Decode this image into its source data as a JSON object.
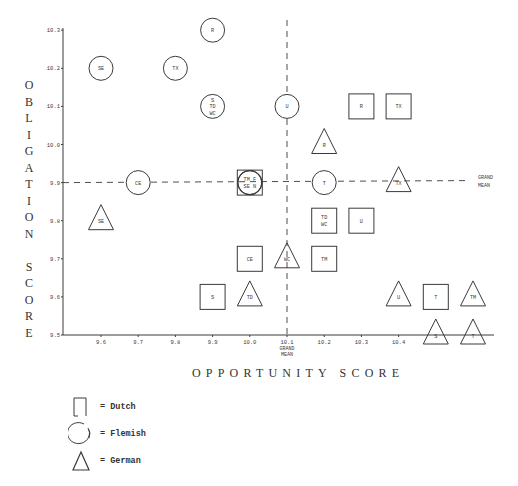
{
  "chart_data": {
    "type": "scatter",
    "title": "",
    "xlabel": "OPPORTUNITY SCORE",
    "ylabel": "OBLIGATION SCORE",
    "xlim": [
      9.5,
      10.6
    ],
    "ylim": [
      9.5,
      10.3
    ],
    "x_ticks": [
      "9.6",
      "9.7",
      "9.8",
      "9.9",
      "10.0",
      "10.1",
      "10.2",
      "10.3",
      "10.4"
    ],
    "y_ticks": [
      "10.3",
      "10.2",
      "10.1",
      "10.0",
      "9.9",
      "9.8",
      "9.7",
      "9.6",
      "9.5"
    ],
    "grid": false,
    "reference_lines": {
      "x_grand_mean": 10.1,
      "y_grand_mean": 9.9,
      "x_grand_mean_label": [
        "GRAND",
        "MEAN"
      ],
      "y_grand_mean_label": [
        "GRAND",
        "MEAN"
      ]
    },
    "legend": [
      {
        "shape": "square",
        "label": "= Dutch"
      },
      {
        "shape": "circle",
        "label": "= Flemish"
      },
      {
        "shape": "triangle",
        "label": "= German"
      }
    ],
    "legend_position": "bottom-left",
    "series": [
      {
        "name": "Dutch",
        "shape": "square",
        "points": [
          {
            "x": 10.3,
            "y": 10.1,
            "label": "R"
          },
          {
            "x": 10.4,
            "y": 10.1,
            "label": "TX"
          },
          {
            "x": 10.0,
            "y": 9.9,
            "label": "TM F\nSE N"
          },
          {
            "x": 10.2,
            "y": 9.8,
            "label": "TD\nWC"
          },
          {
            "x": 10.3,
            "y": 9.8,
            "label": "U"
          },
          {
            "x": 10.0,
            "y": 9.7,
            "label": "CE"
          },
          {
            "x": 10.2,
            "y": 9.7,
            "label": "TM"
          },
          {
            "x": 9.9,
            "y": 9.6,
            "label": "S"
          },
          {
            "x": 10.5,
            "y": 9.6,
            "label": "T"
          }
        ]
      },
      {
        "name": "Flemish",
        "shape": "circle",
        "points": [
          {
            "x": 9.9,
            "y": 10.3,
            "label": "R"
          },
          {
            "x": 9.6,
            "y": 10.2,
            "label": "SE"
          },
          {
            "x": 9.8,
            "y": 10.2,
            "label": "TX"
          },
          {
            "x": 9.9,
            "y": 10.1,
            "label": "S\nTD\nWC"
          },
          {
            "x": 10.1,
            "y": 10.1,
            "label": "U"
          },
          {
            "x": 9.7,
            "y": 9.9,
            "label": "CE"
          },
          {
            "x": 10.0,
            "y": 9.9,
            "label": ""
          },
          {
            "x": 10.2,
            "y": 9.9,
            "label": "T"
          }
        ]
      },
      {
        "name": "German",
        "shape": "triangle",
        "points": [
          {
            "x": 10.2,
            "y": 10.0,
            "label": "R"
          },
          {
            "x": 10.4,
            "y": 9.9,
            "label": "TX"
          },
          {
            "x": 9.6,
            "y": 9.8,
            "label": "SE"
          },
          {
            "x": 10.1,
            "y": 9.7,
            "label": "WC"
          },
          {
            "x": 10.0,
            "y": 9.6,
            "label": "TD"
          },
          {
            "x": 10.4,
            "y": 9.6,
            "label": "U"
          },
          {
            "x": 10.6,
            "y": 9.6,
            "label": "TM"
          },
          {
            "x": 10.5,
            "y": 9.5,
            "label": "S"
          },
          {
            "x": 10.6,
            "y": 9.5,
            "label": "T"
          }
        ]
      }
    ]
  },
  "axes": {
    "ylabel_letters": [
      "O",
      "B",
      "L",
      "I",
      "G",
      "A",
      "T",
      "I",
      "O",
      "N",
      " ",
      "S",
      "C",
      "O",
      "R",
      "E"
    ],
    "xlabel": "OPPORTUNITY SCORE"
  },
  "legend": {
    "dutch": "= Dutch",
    "flemish": "= Flemish",
    "german": "= German"
  },
  "colors": {
    "ink": "#3a3a3a",
    "paper": "#ffffff"
  }
}
